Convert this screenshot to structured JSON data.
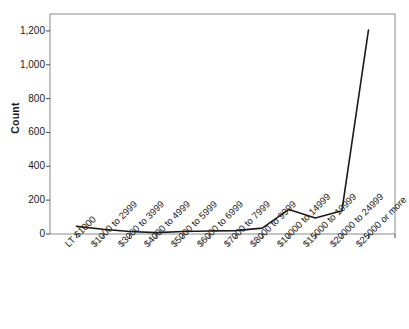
{
  "chart_data": {
    "type": "line",
    "title": "",
    "subtitle": "",
    "xlabel": "",
    "ylabel": "Count",
    "categories": [
      "LT $1000",
      "$1000 to 2999",
      "$3000 to 3999",
      "$4000 to 4999",
      "$5000 to 5999",
      "$6000 to 6999",
      "$7000 to 7999",
      "$8000 to 9999",
      "$10000 to 14999",
      "$15000 to 19999",
      "$20000 to 24999",
      "$25000 or more"
    ],
    "values": [
      45,
      28,
      15,
      8,
      15,
      18,
      20,
      35,
      145,
      95,
      138,
      1205
    ],
    "series": [
      {
        "name": "Count",
        "values": [
          45,
          28,
          15,
          8,
          15,
          18,
          20,
          35,
          145,
          95,
          138,
          1205
        ],
        "color": "#1a1a1a"
      }
    ],
    "ylim": [
      0,
      1300
    ],
    "y_ticks": [
      0,
      200,
      400,
      600,
      800,
      1000,
      1200
    ],
    "y_tick_labels": [
      "0",
      "200",
      "400",
      "600",
      "800",
      "1,000",
      "1,200"
    ],
    "grid": false,
    "legend": false,
    "legend_position": "none",
    "line_color": "#1a1a1a",
    "frame_color": "#8a8a8a",
    "background_color": "#ffffff"
  }
}
